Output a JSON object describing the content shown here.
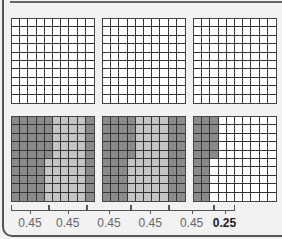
{
  "colors": {
    "dark": "#8a8a8a",
    "light": "#c4c4c4",
    "empty": "#ffffff"
  },
  "top_grids": [
    {
      "shaded": 0
    },
    {
      "shaded": 0
    },
    {
      "shaded": 0
    }
  ],
  "bottom_grids": [
    {
      "pattern": "grid1"
    },
    {
      "pattern": "grid2"
    },
    {
      "pattern": "grid3"
    }
  ],
  "segments": [
    {
      "label": "0.45",
      "shade": "dark"
    },
    {
      "label": "0.45",
      "shade": "light"
    },
    {
      "label": "0.45",
      "shade": "dark"
    },
    {
      "label": "0.45",
      "shade": "light"
    },
    {
      "label": "0.45",
      "shade": "dark"
    },
    {
      "label": "0.25",
      "shade": "empty"
    }
  ]
}
